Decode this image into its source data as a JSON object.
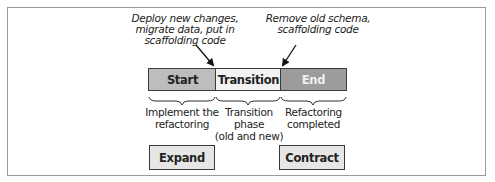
{
  "annotations": {
    "deploy": "Deploy new changes,\nmigrate data, put in\nscaffolding code",
    "remove": "Remove old schema,\nscaffolding code"
  },
  "phases": [
    {
      "label": "Start",
      "fill": "#bdbdbd",
      "text_color": "#222222"
    },
    {
      "label": "Transition",
      "fill": "#f2f2f2",
      "text_color": "#222222"
    },
    {
      "label": "End",
      "fill": "#9c9c9c",
      "text_color": "#f0f0f0"
    }
  ],
  "descriptions": [
    "Implement the\nrefactoring",
    "Transition phase\n(old and new)",
    "Refactoring\ncompleted"
  ],
  "operations": {
    "expand": "Expand",
    "contract": "Contract"
  }
}
